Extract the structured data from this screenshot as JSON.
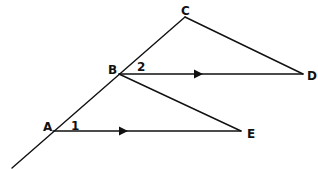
{
  "diagram": {
    "type": "geometry",
    "colors": {
      "stroke": "#111111",
      "background": "#ffffff"
    },
    "points": {
      "A": {
        "label": "A",
        "x": 53,
        "y": 131
      },
      "B": {
        "label": "B",
        "x": 119,
        "y": 74
      },
      "C": {
        "label": "C",
        "x": 185,
        "y": 17
      },
      "D": {
        "label": "D",
        "x": 303,
        "y": 74
      },
      "E": {
        "label": "E",
        "x": 241,
        "y": 131
      }
    },
    "angles": {
      "angle1": {
        "label": "1",
        "at": "A"
      },
      "angle2": {
        "label": "2",
        "at": "B"
      }
    },
    "segments": [
      {
        "name": "transversal",
        "from": "C",
        "to": "extension-below-A"
      },
      {
        "name": "CD",
        "from": "C",
        "to": "D"
      },
      {
        "name": "BD",
        "from": "B",
        "to": "D",
        "parallel_marker": true
      },
      {
        "name": "BE",
        "from": "B",
        "to": "E"
      },
      {
        "name": "AE",
        "from": "A",
        "to": "E",
        "parallel_marker": true
      }
    ]
  }
}
